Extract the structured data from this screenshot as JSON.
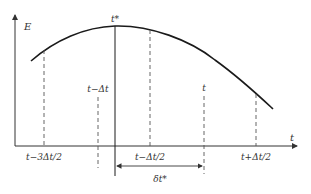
{
  "diagram": {
    "type": "energy-vs-time optimization diagram",
    "axes": {
      "y_label": "E",
      "x_label": "t"
    },
    "curve": {
      "description": "concave energy curve with maximum at t*",
      "peak_label": "t*"
    },
    "markers": [
      {
        "id": "t-3dt2",
        "label": "t−3Δt/2",
        "style": "dashed",
        "label_position": "below-axis"
      },
      {
        "id": "t-dt",
        "label": "t−Δt",
        "style": "dashed",
        "label_position": "above-line"
      },
      {
        "id": "t-star",
        "label": "t*",
        "style": "solid",
        "label_position": "above-curve"
      },
      {
        "id": "t-dt2",
        "label": "t−Δt/2",
        "style": "dashed",
        "label_position": "below-axis"
      },
      {
        "id": "t",
        "label": "t",
        "style": "dashed",
        "label_position": "above-line"
      },
      {
        "id": "t+dt2",
        "label": "t+Δt/2",
        "style": "dashed",
        "label_position": "below-axis"
      }
    ],
    "interval": {
      "label": "δt*",
      "from": "t*",
      "to": "t"
    },
    "colors": {
      "line": "#1a1a1a",
      "dashed": "#555555",
      "axis": "#333333"
    }
  }
}
